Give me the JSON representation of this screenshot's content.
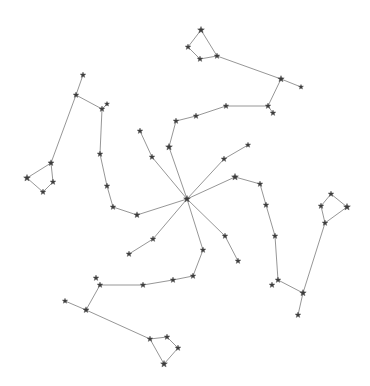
{
  "diagram": {
    "title": "Constellation network",
    "colors": {
      "background": "#ffffff",
      "edge": "#8a8a8a",
      "star": "#3c3c3c"
    },
    "nodes": [
      {
        "id": "hub",
        "x": 187,
        "y": 199,
        "r": 3.6
      },
      {
        "id": "nw1",
        "x": 83,
        "y": 75,
        "r": 3
      },
      {
        "id": "nw2",
        "x": 76,
        "y": 95,
        "r": 3
      },
      {
        "id": "nw3",
        "x": 102,
        "y": 109,
        "r": 3
      },
      {
        "id": "nw4",
        "x": 107,
        "y": 104,
        "r": 2.6
      },
      {
        "id": "nw5",
        "x": 51,
        "y": 163,
        "r": 3.2
      },
      {
        "id": "nw6",
        "x": 27,
        "y": 178,
        "r": 3.6
      },
      {
        "id": "nw7",
        "x": 53,
        "y": 182,
        "r": 3
      },
      {
        "id": "nw8",
        "x": 43,
        "y": 192,
        "r": 3
      },
      {
        "id": "nw9",
        "x": 100,
        "y": 154,
        "r": 3
      },
      {
        "id": "nw10",
        "x": 107,
        "y": 186,
        "r": 3
      },
      {
        "id": "nw11",
        "x": 113,
        "y": 207,
        "r": 3
      },
      {
        "id": "nw12",
        "x": 137,
        "y": 215,
        "r": 3.2
      },
      {
        "id": "ne1",
        "x": 201,
        "y": 30,
        "r": 3.6
      },
      {
        "id": "ne2",
        "x": 188,
        "y": 47,
        "r": 3
      },
      {
        "id": "ne3",
        "x": 200,
        "y": 59,
        "r": 3
      },
      {
        "id": "ne4",
        "x": 217,
        "y": 56,
        "r": 3
      },
      {
        "id": "ne5",
        "x": 281,
        "y": 79,
        "r": 3.4
      },
      {
        "id": "ne6",
        "x": 301,
        "y": 87,
        "r": 2.6
      },
      {
        "id": "ne7",
        "x": 268,
        "y": 106,
        "r": 3
      },
      {
        "id": "ne8",
        "x": 273,
        "y": 113,
        "r": 3
      },
      {
        "id": "ne9",
        "x": 226,
        "y": 106,
        "r": 3
      },
      {
        "id": "ne10",
        "x": 196,
        "y": 116,
        "r": 3
      },
      {
        "id": "ne11",
        "x": 176,
        "y": 121,
        "r": 3
      },
      {
        "id": "c1",
        "x": 140,
        "y": 131,
        "r": 3
      },
      {
        "id": "c2",
        "x": 152,
        "y": 157,
        "r": 3
      },
      {
        "id": "c3",
        "x": 169,
        "y": 147,
        "r": 3.6
      },
      {
        "id": "c4",
        "x": 248,
        "y": 145,
        "r": 2.8
      },
      {
        "id": "c5",
        "x": 224,
        "y": 159,
        "r": 3
      },
      {
        "id": "c6",
        "x": 235,
        "y": 177,
        "r": 3.6
      },
      {
        "id": "c7",
        "x": 260,
        "y": 184,
        "r": 3
      },
      {
        "id": "se1",
        "x": 266,
        "y": 205,
        "r": 3
      },
      {
        "id": "se2",
        "x": 275,
        "y": 236,
        "r": 3
      },
      {
        "id": "se3",
        "x": 278,
        "y": 280,
        "r": 3
      },
      {
        "id": "se4",
        "x": 272,
        "y": 285,
        "r": 3
      },
      {
        "id": "se5",
        "x": 303,
        "y": 293,
        "r": 3.4
      },
      {
        "id": "se6",
        "x": 298,
        "y": 315,
        "r": 3
      },
      {
        "id": "se7",
        "x": 331,
        "y": 194,
        "r": 3
      },
      {
        "id": "se8",
        "x": 321,
        "y": 206,
        "r": 3
      },
      {
        "id": "se9",
        "x": 347,
        "y": 207,
        "r": 3.6
      },
      {
        "id": "se10",
        "x": 325,
        "y": 223,
        "r": 3
      },
      {
        "id": "se11",
        "x": 225,
        "y": 236,
        "r": 3
      },
      {
        "id": "se12",
        "x": 238,
        "y": 261,
        "r": 3
      },
      {
        "id": "s1",
        "x": 203,
        "y": 250,
        "r": 3
      },
      {
        "id": "s2",
        "x": 193,
        "y": 276,
        "r": 3
      },
      {
        "id": "s3",
        "x": 173,
        "y": 280,
        "r": 3
      },
      {
        "id": "s4",
        "x": 143,
        "y": 285,
        "r": 3
      },
      {
        "id": "s5",
        "x": 100,
        "y": 285,
        "r": 3
      },
      {
        "id": "s6",
        "x": 96,
        "y": 278,
        "r": 3
      },
      {
        "id": "s7",
        "x": 86,
        "y": 310,
        "r": 3.2
      },
      {
        "id": "s8",
        "x": 65,
        "y": 301,
        "r": 2.8
      },
      {
        "id": "s9",
        "x": 150,
        "y": 339,
        "r": 3
      },
      {
        "id": "s10",
        "x": 167,
        "y": 337,
        "r": 3
      },
      {
        "id": "s11",
        "x": 178,
        "y": 348,
        "r": 3
      },
      {
        "id": "s12",
        "x": 164,
        "y": 364,
        "r": 3.6
      },
      {
        "id": "s13",
        "x": 153,
        "y": 239,
        "r": 3
      },
      {
        "id": "s14",
        "x": 129,
        "y": 254,
        "r": 3
      }
    ],
    "edges": [
      [
        "nw1",
        "nw2"
      ],
      [
        "nw2",
        "nw3"
      ],
      [
        "nw3",
        "nw4"
      ],
      [
        "nw2",
        "nw5"
      ],
      [
        "nw5",
        "nw6"
      ],
      [
        "nw6",
        "nw8"
      ],
      [
        "nw8",
        "nw7"
      ],
      [
        "nw7",
        "nw5"
      ],
      [
        "nw3",
        "nw9"
      ],
      [
        "nw9",
        "nw10"
      ],
      [
        "nw10",
        "nw11"
      ],
      [
        "nw11",
        "nw12"
      ],
      [
        "nw12",
        "hub"
      ],
      [
        "ne1",
        "ne2"
      ],
      [
        "ne2",
        "ne3"
      ],
      [
        "ne3",
        "ne4"
      ],
      [
        "ne4",
        "ne1"
      ],
      [
        "ne4",
        "ne5"
      ],
      [
        "ne5",
        "ne6"
      ],
      [
        "ne5",
        "ne7"
      ],
      [
        "ne7",
        "ne8"
      ],
      [
        "ne7",
        "ne9"
      ],
      [
        "ne9",
        "ne10"
      ],
      [
        "ne10",
        "ne11"
      ],
      [
        "ne11",
        "c3"
      ],
      [
        "c1",
        "c2"
      ],
      [
        "c2",
        "hub"
      ],
      [
        "c3",
        "hub"
      ],
      [
        "c4",
        "c5"
      ],
      [
        "c5",
        "hub"
      ],
      [
        "c6",
        "hub"
      ],
      [
        "c6",
        "c7"
      ],
      [
        "c7",
        "se1"
      ],
      [
        "se1",
        "se2"
      ],
      [
        "se2",
        "se3"
      ],
      [
        "se3",
        "se5"
      ],
      [
        "se5",
        "se6"
      ],
      [
        "se5",
        "se10"
      ],
      [
        "se10",
        "se8"
      ],
      [
        "se8",
        "se7"
      ],
      [
        "se7",
        "se9"
      ],
      [
        "se9",
        "se10"
      ],
      [
        "hub",
        "se11"
      ],
      [
        "se11",
        "se12"
      ],
      [
        "hub",
        "s1"
      ],
      [
        "s1",
        "s2"
      ],
      [
        "s2",
        "s3"
      ],
      [
        "s3",
        "s4"
      ],
      [
        "s4",
        "s5"
      ],
      [
        "s5",
        "s7"
      ],
      [
        "s7",
        "s8"
      ],
      [
        "s7",
        "s9"
      ],
      [
        "s9",
        "s10"
      ],
      [
        "s10",
        "s11"
      ],
      [
        "s11",
        "s12"
      ],
      [
        "s12",
        "s9"
      ],
      [
        "hub",
        "s13"
      ],
      [
        "s13",
        "s14"
      ]
    ]
  }
}
